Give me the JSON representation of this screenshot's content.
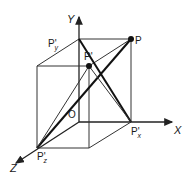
{
  "diagram": {
    "axes": {
      "x": "X",
      "y": "Y",
      "z": "Z"
    },
    "points": {
      "origin": "O",
      "p": "P",
      "p_prime": "P'",
      "p_y": "P'",
      "p_y_sub": "y",
      "p_x": "P'",
      "p_x_sub": "x",
      "p_z": "P'",
      "p_z_sub": "z"
    },
    "colors": {
      "line": "#222222",
      "background": "#ffffff"
    }
  }
}
